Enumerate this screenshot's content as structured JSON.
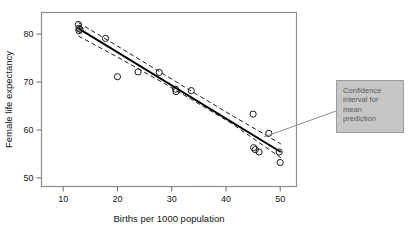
{
  "figure": {
    "caption_fragment": "",
    "annotation": {
      "text": "Confidence interval for mean prediction",
      "lines": [
        "Confidence",
        "interval for",
        "mean",
        "prediction"
      ],
      "box_color": "#c6c6c6",
      "text_color": "#5c5c5c"
    }
  },
  "chart_data": {
    "type": "scatter",
    "title": "",
    "xlabel": "Births per 1000 population",
    "ylabel": "Female life expectancy",
    "xlim": [
      6,
      53
    ],
    "ylim": [
      48.2,
      84.5
    ],
    "xticks": [
      10,
      20,
      30,
      40,
      50
    ],
    "yticks": [
      50,
      60,
      70,
      80
    ],
    "xtick_labels": [
      "10",
      "20",
      "30",
      "40",
      "50"
    ],
    "ytick_labels": [
      "50",
      "60",
      "70",
      "80"
    ],
    "grid": false,
    "legend": null,
    "marker": "open-circle",
    "points": [
      {
        "x": 12.8,
        "y": 82.0
      },
      {
        "x": 12.9,
        "y": 81.2
      },
      {
        "x": 12.9,
        "y": 80.7
      },
      {
        "x": 13.1,
        "y": 81.0
      },
      {
        "x": 17.8,
        "y": 79.1
      },
      {
        "x": 20.0,
        "y": 71.1
      },
      {
        "x": 23.8,
        "y": 72.1
      },
      {
        "x": 27.7,
        "y": 72.0
      },
      {
        "x": 30.7,
        "y": 68.5
      },
      {
        "x": 30.8,
        "y": 68.0
      },
      {
        "x": 33.6,
        "y": 68.2
      },
      {
        "x": 45.0,
        "y": 63.3
      },
      {
        "x": 45.1,
        "y": 56.3
      },
      {
        "x": 45.4,
        "y": 55.9
      },
      {
        "x": 46.1,
        "y": 55.4
      },
      {
        "x": 47.9,
        "y": 59.3
      },
      {
        "x": 49.8,
        "y": 55.4
      },
      {
        "x": 50.0,
        "y": 53.2
      }
    ],
    "fit_line": {
      "label": "least-squares regression line",
      "style": "solid",
      "x0": 12.8,
      "y0": 81.2,
      "x1": 50.1,
      "y1": 55.4
    },
    "confidence_band": {
      "label": "Confidence interval for mean prediction",
      "style": "dashed",
      "upper": [
        {
          "x": 12.8,
          "y": 82.4
        },
        {
          "x": 20.0,
          "y": 77.5
        },
        {
          "x": 27.7,
          "y": 72.2
        },
        {
          "x": 33.6,
          "y": 68.1
        },
        {
          "x": 41.0,
          "y": 63.1
        },
        {
          "x": 50.1,
          "y": 57.1
        }
      ],
      "lower": [
        {
          "x": 12.8,
          "y": 79.6
        },
        {
          "x": 20.0,
          "y": 75.2
        },
        {
          "x": 27.7,
          "y": 70.3
        },
        {
          "x": 33.6,
          "y": 66.4
        },
        {
          "x": 41.0,
          "y": 61.4
        },
        {
          "x": 50.1,
          "y": 54.2
        }
      ]
    }
  }
}
